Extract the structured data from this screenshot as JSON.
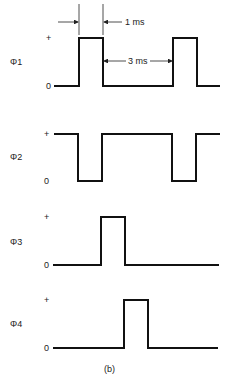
{
  "diagram": {
    "caption": "(b)",
    "dimensions": {
      "pulse_width_label": "1 ms",
      "period_gap_label": "3 ms"
    },
    "level_labels": {
      "high": "+",
      "low": "0"
    },
    "signals": [
      {
        "name": "Φ1",
        "type": "positive pulses",
        "pulses_x": [
          [
            79,
            103
          ],
          [
            173,
            197
          ]
        ]
      },
      {
        "name": "Φ2",
        "type": "negative pulses",
        "pulses_x": [
          [
            78,
            102
          ],
          [
            172,
            196
          ]
        ]
      },
      {
        "name": "Φ3",
        "type": "positive pulse",
        "pulses_x": [
          [
            101,
            125
          ]
        ]
      },
      {
        "name": "Φ4",
        "type": "positive pulse",
        "pulses_x": [
          [
            124,
            148
          ]
        ]
      }
    ],
    "colors": {
      "line": "#111111",
      "background": "#ffffff"
    }
  }
}
